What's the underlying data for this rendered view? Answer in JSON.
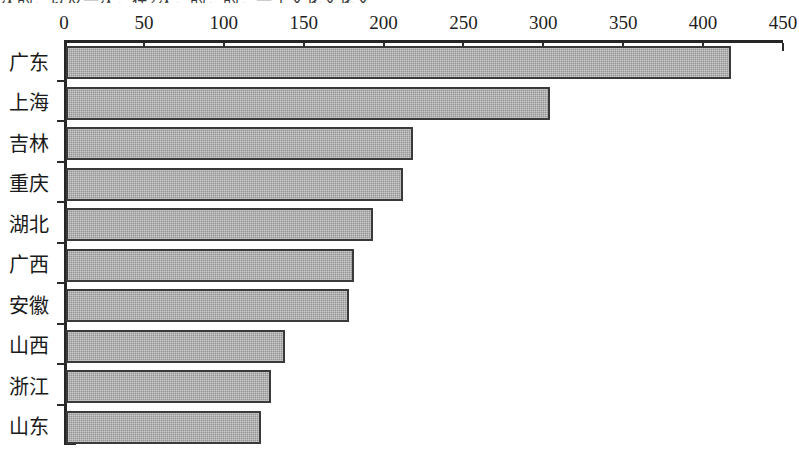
{
  "page": {
    "top_text_remnant": "次的，以及一次，在2次，的，的，一个文化文化文"
  },
  "chart_data": {
    "type": "bar",
    "orientation": "horizontal",
    "title": "",
    "subtitle": "",
    "xlabel": "",
    "ylabel": "",
    "categories": [
      "广东",
      "上海",
      "吉林",
      "重庆",
      "湖北",
      "广西",
      "安徽",
      "山西",
      "浙江",
      "山东"
    ],
    "values": [
      416,
      303,
      217,
      211,
      192,
      180,
      177,
      137,
      128,
      122
    ],
    "series": [
      {
        "name": "",
        "values": [
          416,
          303,
          217,
          211,
          192,
          180,
          177,
          137,
          128,
          122
        ]
      }
    ],
    "xlim": [
      0,
      450
    ],
    "xticks": [
      0,
      50,
      100,
      150,
      200,
      250,
      300,
      350,
      400,
      450
    ],
    "xtick_labels": [
      "0",
      "50",
      "100",
      "150",
      "200",
      "250",
      "300",
      "350",
      "400",
      "450"
    ],
    "grid": false,
    "legend": null,
    "axis_position": "top",
    "bar_fill_color": "#9c9c9c",
    "bar_border_color": "#3a3a3a",
    "axis_color": "#262626",
    "background_color": "#ffffff"
  }
}
